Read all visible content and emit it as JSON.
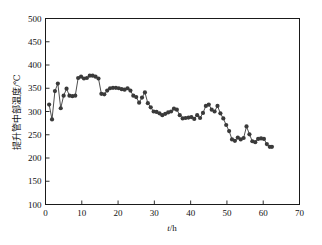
{
  "chart_data": {
    "type": "scatter",
    "title": "",
    "subtitle": "",
    "xlabel": "t/h",
    "xlabel_italic_part": "t",
    "xlabel_rest": "/h",
    "ylabel": "提升管中部温度/℃",
    "xlim": [
      0,
      70
    ],
    "ylim": [
      100,
      500
    ],
    "xticks": [
      0,
      10,
      20,
      30,
      40,
      50,
      60,
      70
    ],
    "yticks": [
      100,
      150,
      200,
      250,
      300,
      350,
      400,
      450,
      500
    ],
    "grid": false,
    "legend": null,
    "marker": "filled-circle",
    "marker_color": "#3a3a3a",
    "line_color": "#3a3a3a",
    "series": [
      {
        "name": "提升管中部温度",
        "x": [
          1.0,
          1.8,
          2.6,
          3.4,
          4.2,
          5.0,
          5.8,
          6.6,
          7.4,
          8.2,
          9.0,
          9.8,
          10.6,
          11.4,
          12.2,
          13.0,
          13.8,
          14.6,
          15.4,
          16.2,
          17.0,
          17.8,
          18.6,
          19.4,
          20.2,
          21.0,
          21.8,
          22.6,
          23.4,
          24.2,
          25.0,
          25.8,
          26.6,
          27.4,
          28.2,
          29.0,
          29.8,
          30.6,
          31.4,
          32.2,
          33.0,
          33.8,
          34.6,
          35.4,
          36.2,
          37.0,
          37.8,
          38.6,
          39.4,
          40.2,
          41.0,
          41.8,
          42.6,
          43.4,
          44.2,
          45.0,
          45.8,
          46.6,
          47.4,
          48.2,
          49.0,
          49.8,
          50.6,
          51.4,
          52.2,
          53.0,
          53.8,
          54.6,
          55.4,
          56.2,
          57.0,
          57.8,
          58.6,
          59.4,
          60.2,
          61.0,
          61.8,
          62.4
        ],
        "y": [
          315,
          283,
          344,
          360,
          307,
          334,
          349,
          334,
          333,
          334,
          372,
          375,
          371,
          372,
          377,
          377,
          375,
          371,
          338,
          337,
          345,
          350,
          351,
          351,
          350,
          348,
          347,
          350,
          345,
          334,
          331,
          319,
          330,
          341,
          318,
          309,
          300,
          299,
          296,
          292,
          295,
          298,
          300,
          306,
          304,
          292,
          285,
          286,
          287,
          288,
          284,
          292,
          286,
          297,
          312,
          315,
          304,
          300,
          312,
          296,
          285,
          271,
          258,
          240,
          237,
          244,
          240,
          243,
          268,
          251,
          236,
          234,
          241,
          242,
          241,
          230,
          224,
          224
        ]
      }
    ]
  },
  "axes": {
    "x_tick_labels": [
      "0",
      "10",
      "20",
      "30",
      "40",
      "50",
      "60",
      "70"
    ],
    "y_tick_labels": [
      "100",
      "150",
      "200",
      "250",
      "300",
      "350",
      "400",
      "450",
      "500"
    ]
  },
  "colors": {
    "background": "#ffffff",
    "axis": "#1a1a1a",
    "data": "#3a3a3a"
  }
}
